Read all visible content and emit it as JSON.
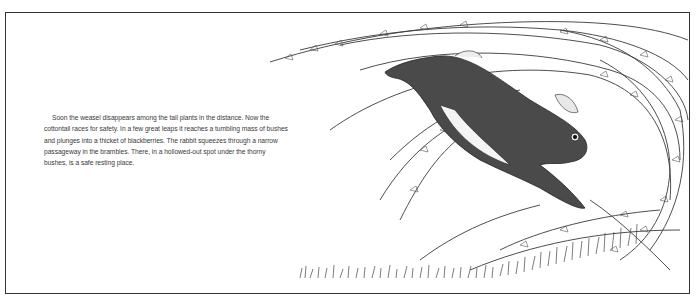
{
  "page": {
    "story_paragraph": "Soon the weasel disappears among the tall plants in the distance. Now the cottontail races for safety. In a few great leaps it reaches a tumbling mass of bushes and plunges into a thicket of blackberries. The rabbit squeezes through a narrow passageway in the brambles. There, in a hollowed-out spot under the thorny bushes, is a safe resting place."
  },
  "illustration": {
    "subject": "cottontail rabbit leaping into blackberry bramble thicket",
    "elements": [
      "rabbit",
      "bramble-branches",
      "grass"
    ]
  },
  "colors": {
    "ink": "#2a2a2a",
    "paper": "#ffffff",
    "text": "#3a3a3a"
  }
}
